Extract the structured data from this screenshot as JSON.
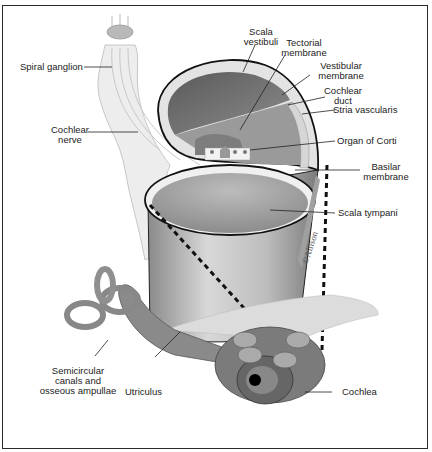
{
  "diagram": {
    "labels": {
      "spiral_ganglion": "Spiral ganglion",
      "cochlear_nerve_1": "Cochlear",
      "cochlear_nerve_2": "nerve",
      "scala_vestibuli_1": "Scala",
      "scala_vestibuli_2": "vestibuli",
      "tectorial_membrane_1": "Tectorial",
      "tectorial_membrane_2": "membrane",
      "vestibular_membrane_1": "Vestibular",
      "vestibular_membrane_2": "membrane",
      "cochlear_duct_1": "Cochlear",
      "cochlear_duct_2": "duct",
      "stria_vascularis": "Stria vascularis",
      "organ_of_corti": "Organ of Corti",
      "basilar_membrane_1": "Basilar",
      "basilar_membrane_2": "membrane",
      "scala_tympani": "Scala tympani",
      "semicircular_1": "Semicircular",
      "semicircular_2": "canals and",
      "semicircular_3": "osseous ampullae",
      "utriculus": "Utriculus",
      "cochlea": "Cochlea"
    },
    "watermark": "©Allison"
  }
}
